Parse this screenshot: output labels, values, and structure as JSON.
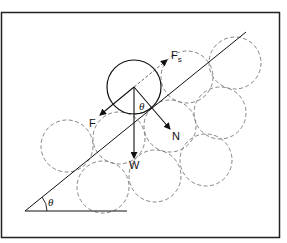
{
  "diagram": {
    "title": "",
    "frame": {
      "x": 1,
      "y": 12,
      "width": 279,
      "height": 226
    },
    "incline": {
      "x1": 25,
      "y1": 211,
      "x2": 246,
      "y2": 32,
      "base_x2": 127
    },
    "angle_label": "θ",
    "sphere": {
      "cx": 134,
      "cy": 87,
      "r": 27
    },
    "packing_circles": [
      {
        "cx": 67,
        "cy": 146,
        "r": 26
      },
      {
        "cx": 119,
        "cy": 138,
        "r": 26
      },
      {
        "cx": 170,
        "cy": 126,
        "r": 26
      },
      {
        "cx": 220,
        "cy": 113,
        "r": 26
      },
      {
        "cx": 187,
        "cy": 77,
        "r": 26
      },
      {
        "cx": 235,
        "cy": 63,
        "r": 26
      },
      {
        "cx": 103,
        "cy": 187,
        "r": 26
      },
      {
        "cx": 155,
        "cy": 176,
        "r": 26
      },
      {
        "cx": 206,
        "cy": 160,
        "r": 26
      }
    ],
    "forces": {
      "F": {
        "label": "F",
        "description": "force down the slope"
      },
      "Fs": {
        "label": "F",
        "subscript": "s",
        "description": "friction force up the slope"
      },
      "N": {
        "label": "N",
        "description": "normal force"
      },
      "W": {
        "label": "W",
        "description": "weight"
      }
    },
    "inner_angle_label": "θ",
    "colors": {
      "line": "#111111",
      "dashed": "#777777",
      "background": "#ffffff"
    }
  }
}
